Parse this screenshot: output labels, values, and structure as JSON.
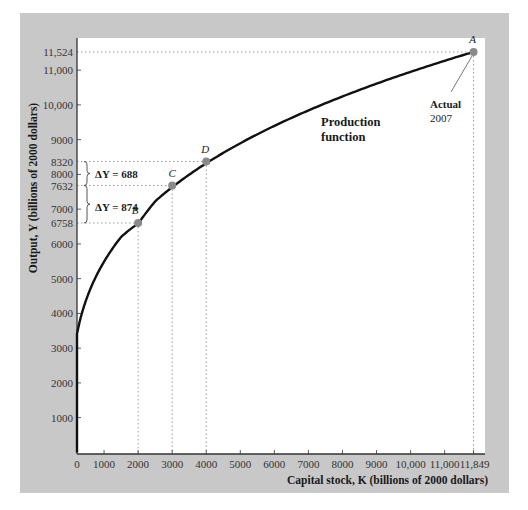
{
  "chart_data": {
    "type": "line",
    "title": "",
    "xlabel": "Capital stock, K (billions of 2000 dollars)",
    "ylabel": "Output, Y (billions of 2000 dollars)",
    "xlim": [
      0,
      12200
    ],
    "ylim": [
      0,
      12200
    ],
    "grid": false,
    "legend": null,
    "x_ticks": [
      {
        "value": 0,
        "label": "0"
      },
      {
        "value": 1000,
        "label": "1000"
      },
      {
        "value": 2000,
        "label": "2000"
      },
      {
        "value": 3000,
        "label": "3000"
      },
      {
        "value": 4000,
        "label": "4000"
      },
      {
        "value": 5000,
        "label": "5000"
      },
      {
        "value": 6000,
        "label": "6000"
      },
      {
        "value": 7000,
        "label": "7000"
      },
      {
        "value": 8000,
        "label": "8000"
      },
      {
        "value": 9000,
        "label": "9000"
      },
      {
        "value": 10000,
        "label": "10,000"
      },
      {
        "value": 11000,
        "label": "11,000"
      },
      {
        "value": 11849,
        "label": "11,849"
      }
    ],
    "y_ticks": [
      {
        "value": 1000,
        "label": "1000"
      },
      {
        "value": 2000,
        "label": "2000"
      },
      {
        "value": 3000,
        "label": "3000"
      },
      {
        "value": 4000,
        "label": "4000"
      },
      {
        "value": 5000,
        "label": "5000"
      },
      {
        "value": 6000,
        "label": "6000"
      },
      {
        "value": 6758,
        "label": "6758"
      },
      {
        "value": 7000,
        "label": "7000"
      },
      {
        "value": 7632,
        "label": "7632"
      },
      {
        "value": 8000,
        "label": "8000"
      },
      {
        "value": 8320,
        "label": "8320"
      },
      {
        "value": 9000,
        "label": "9000"
      },
      {
        "value": 10000,
        "label": "10,000"
      },
      {
        "value": 11000,
        "label": "11,000"
      },
      {
        "value": 11524,
        "label": "11,524"
      }
    ],
    "series": [
      {
        "name": "Production function",
        "function": "Y = 11524 * (K / 11849)^0.3",
        "x": [
          0,
          250,
          500,
          1000,
          1500,
          2000,
          3000,
          4000,
          5000,
          6000,
          7000,
          8000,
          9000,
          10000,
          11000,
          11849
        ],
        "values": [
          0,
          3611,
          4446,
          5474,
          6173,
          6758,
          7632,
          8320,
          8893,
          9389,
          9825,
          10224,
          10587,
          10922,
          11236,
          11524
        ]
      }
    ],
    "points": [
      {
        "label": "A",
        "K": 11849,
        "Y": 11524,
        "note": "Actual 2007"
      },
      {
        "label": "B",
        "K": 2000,
        "Y": 6758
      },
      {
        "label": "C",
        "K": 3000,
        "Y": 7632
      },
      {
        "label": "D",
        "K": 4000,
        "Y": 8320
      }
    ],
    "annotations": [
      {
        "text": "ΔY = 688",
        "from_Y": 7632,
        "to_Y": 8320
      },
      {
        "text": "ΔY = 874",
        "from_Y": 6758,
        "to_Y": 7632
      },
      {
        "text": "Production function",
        "kind": "curve-label"
      },
      {
        "text": "Actual 2007",
        "kind": "point-callout",
        "point": "A"
      }
    ]
  },
  "labels": {
    "curve_label_line1": "Production",
    "curve_label_line2": "function",
    "callout_line1": "Actual",
    "callout_line2": "2007",
    "delta_upper": "ΔY = 688",
    "delta_lower": "ΔY = 874"
  },
  "colors": {
    "panel": "#c8c8c8",
    "plot_bg": "#ffffff",
    "curve": "#111111",
    "marker": "#8a8a8a",
    "guide": "#9a9a9a",
    "axis": "#333333"
  }
}
